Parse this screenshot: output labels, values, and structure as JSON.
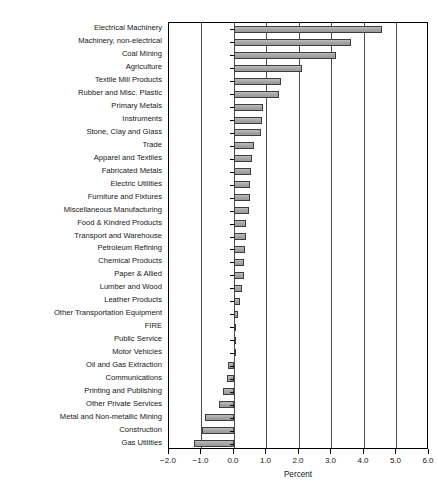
{
  "chart_data": {
    "type": "bar",
    "orientation": "horizontal",
    "title": "",
    "xlabel": "Percent",
    "ylabel": "",
    "xlim": [
      -2.0,
      6.0
    ],
    "xticks": [
      "-2.0",
      "-1.0",
      "0.0",
      "1.0",
      "2.0",
      "3.0",
      "4.0",
      "5.0",
      "6.0"
    ],
    "xtick_values": [
      -2.0,
      -1.0,
      0.0,
      1.0,
      2.0,
      3.0,
      4.0,
      5.0,
      6.0
    ],
    "grid": true,
    "grid_axis": "x",
    "legend": false,
    "bar_fill": "#a8a8a8",
    "bar_edge": "#3d3d3d",
    "categories": [
      "Electrical Machinery",
      "Machinery, non-electrical",
      "Coal Mining",
      "Agriculture",
      "Textile Mill Products",
      "Rubber and Misc. Plastic",
      "Primary Metals",
      "Instruments",
      "Stone, Clay and Glass",
      "Trade",
      "Apparel and Textiles",
      "Fabricated Metals",
      "Electric Utilities",
      "Furniture and Fixtures",
      "Miscellaneous Manufacturing",
      "Food & Kindred Products",
      "Transport and Warehouse",
      "Petroleum Refining",
      "Chemical Products",
      "Paper & Allied",
      "Lumber and Wood",
      "Leather Products",
      "Other Transportation Equipment",
      "FIRE",
      "Public Service",
      "Motor Vehicles",
      "Oil and Gas Extraction",
      "Communications",
      "Printing and Publishing",
      "Other Private Services",
      "Metal and Non-metallic Mining",
      "Construction",
      "Gas Utilities"
    ],
    "values": [
      4.55,
      3.6,
      3.15,
      2.1,
      1.44,
      1.38,
      0.88,
      0.86,
      0.84,
      0.6,
      0.56,
      0.52,
      0.5,
      0.48,
      0.46,
      0.38,
      0.36,
      0.34,
      0.32,
      0.3,
      0.24,
      0.18,
      0.12,
      0.05,
      0.0,
      0.0,
      -0.17,
      -0.23,
      -0.33,
      -0.47,
      -0.88,
      -1.0,
      -1.24
    ]
  }
}
